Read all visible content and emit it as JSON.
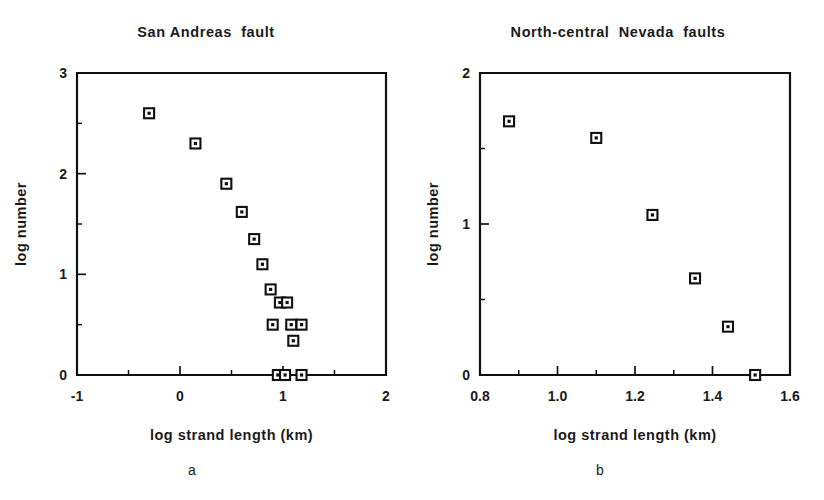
{
  "figure": {
    "background": "#ffffff",
    "ink_color": "#111111"
  },
  "panels": [
    {
      "letter": "a",
      "title": "San Andreas  fault",
      "xlabel": "log  strand  length  (km)",
      "ylabel": "log  number",
      "xticks": [
        "-1",
        "0",
        "1",
        "2"
      ],
      "yticks": [
        "3",
        "2",
        "1",
        "0"
      ]
    },
    {
      "letter": "b",
      "title": "North-central  Nevada  faults",
      "xlabel": "log  strand  length  (km)",
      "ylabel": "log  number",
      "xticks": [
        "0.8",
        "1.0",
        "1.2",
        "1.4",
        "1.6"
      ],
      "yticks": [
        "2",
        "1",
        "0"
      ]
    }
  ],
  "chart_data": [
    {
      "type": "scatter",
      "title": "San Andreas fault",
      "xlabel": "log strand length (km)",
      "ylabel": "log number",
      "xlim": [
        -1,
        2
      ],
      "ylim": [
        0,
        3
      ],
      "xticks": [
        -1,
        0,
        1,
        2
      ],
      "yticks": [
        0,
        1,
        2,
        3
      ],
      "minor_ticks": true,
      "grid": false,
      "legend": null,
      "marker": "open-square-with-dot",
      "points": [
        {
          "x": -0.3,
          "y": 2.6
        },
        {
          "x": 0.15,
          "y": 2.3
        },
        {
          "x": 0.45,
          "y": 1.9
        },
        {
          "x": 0.6,
          "y": 1.62
        },
        {
          "x": 0.72,
          "y": 1.35
        },
        {
          "x": 0.8,
          "y": 1.1
        },
        {
          "x": 0.88,
          "y": 0.85
        },
        {
          "x": 0.97,
          "y": 0.72
        },
        {
          "x": 1.04,
          "y": 0.72
        },
        {
          "x": 0.9,
          "y": 0.5
        },
        {
          "x": 1.08,
          "y": 0.5
        },
        {
          "x": 1.18,
          "y": 0.5
        },
        {
          "x": 1.1,
          "y": 0.34
        },
        {
          "x": 0.95,
          "y": 0.0
        },
        {
          "x": 1.02,
          "y": 0.0
        },
        {
          "x": 1.18,
          "y": 0.0
        }
      ]
    },
    {
      "type": "scatter",
      "title": "North-central Nevada faults",
      "xlabel": "log strand length (km)",
      "ylabel": "log number",
      "xlim": [
        0.8,
        1.6
      ],
      "ylim": [
        0,
        2
      ],
      "xticks": [
        0.8,
        1.0,
        1.2,
        1.4,
        1.6
      ],
      "yticks": [
        0,
        1,
        2
      ],
      "minor_ticks": true,
      "grid": false,
      "legend": null,
      "marker": "open-square-with-dot",
      "points": [
        {
          "x": 0.875,
          "y": 1.68
        },
        {
          "x": 1.1,
          "y": 1.57
        },
        {
          "x": 1.245,
          "y": 1.06
        },
        {
          "x": 1.355,
          "y": 0.64
        },
        {
          "x": 1.44,
          "y": 0.32
        },
        {
          "x": 1.51,
          "y": 0.0
        }
      ]
    }
  ]
}
